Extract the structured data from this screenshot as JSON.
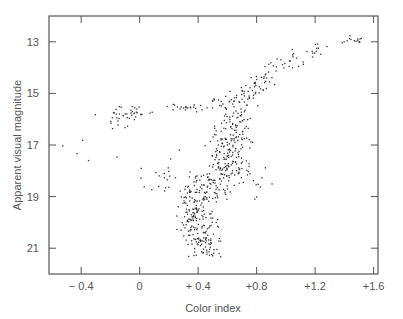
{
  "chart_data": {
    "type": "scatter",
    "title": "",
    "xlabel": "Color index",
    "ylabel": "Apparent visual magnitude",
    "xlim": [
      -0.62,
      1.63
    ],
    "ylim": [
      12.0,
      22.0
    ],
    "y_inverted": true,
    "grid": false,
    "legend": "none",
    "x_ticks": [
      {
        "value": -0.4,
        "label": "− 0.4"
      },
      {
        "value": 0,
        "label": "0"
      },
      {
        "value": 0.4,
        "label": "+ 0.4"
      },
      {
        "value": 0.8,
        "label": "+0.8"
      },
      {
        "value": 1.2,
        "label": "+1.2"
      },
      {
        "value": 1.6,
        "label": "+1.6"
      }
    ],
    "y_ticks": [
      {
        "value": 13,
        "label": "13"
      },
      {
        "value": 15,
        "label": "15"
      },
      {
        "value": 17,
        "label": "17"
      },
      {
        "value": 19,
        "label": "19"
      },
      {
        "value": 21,
        "label": "21"
      }
    ],
    "point_color": "#333333",
    "series": [
      {
        "name": "red giant branch",
        "clusters": [
          {
            "x": 1.45,
            "y": 12.9,
            "sx": 0.05,
            "sy": 0.1,
            "n": 14
          },
          {
            "x": 1.2,
            "y": 13.3,
            "sx": 0.06,
            "sy": 0.2,
            "n": 14
          },
          {
            "x": 1.0,
            "y": 13.7,
            "sx": 0.05,
            "sy": 0.2,
            "n": 14
          },
          {
            "x": 0.9,
            "y": 14.2,
            "sx": 0.04,
            "sy": 0.2,
            "n": 16
          },
          {
            "x": 0.8,
            "y": 14.6,
            "sx": 0.04,
            "sy": 0.2,
            "n": 20
          },
          {
            "x": 0.72,
            "y": 15.1,
            "sx": 0.05,
            "sy": 0.2,
            "n": 24
          }
        ]
      },
      {
        "name": "subgiant / upper main sequence",
        "clusters": [
          {
            "x": 0.65,
            "y": 15.9,
            "sx": 0.06,
            "sy": 0.35,
            "n": 50
          },
          {
            "x": 0.62,
            "y": 16.9,
            "sx": 0.07,
            "sy": 0.4,
            "n": 90
          },
          {
            "x": 0.6,
            "y": 17.8,
            "sx": 0.07,
            "sy": 0.35,
            "n": 80
          },
          {
            "x": 0.55,
            "y": 15.3,
            "sx": 0.06,
            "sy": 0.15,
            "n": 14
          }
        ]
      },
      {
        "name": "main sequence turnoff and dwarfs",
        "clusters": [
          {
            "x": 0.45,
            "y": 18.6,
            "sx": 0.09,
            "sy": 0.3,
            "n": 80
          },
          {
            "x": 0.38,
            "y": 19.4,
            "sx": 0.05,
            "sy": 0.35,
            "n": 70
          },
          {
            "x": 0.4,
            "y": 20.2,
            "sx": 0.06,
            "sy": 0.35,
            "n": 70
          },
          {
            "x": 0.45,
            "y": 20.9,
            "sx": 0.06,
            "sy": 0.25,
            "n": 50
          }
        ]
      },
      {
        "name": "horizontal branch",
        "clusters": [
          {
            "x": -0.05,
            "y": 15.7,
            "sx": 0.07,
            "sy": 0.15,
            "n": 30
          },
          {
            "x": -0.15,
            "y": 16.0,
            "sx": 0.04,
            "sy": 0.2,
            "n": 12
          },
          {
            "x": 0.3,
            "y": 15.55,
            "sx": 0.06,
            "sy": 0.08,
            "n": 22
          }
        ]
      },
      {
        "name": "field / blue stragglers",
        "clusters": [
          {
            "x": 0.15,
            "y": 18.2,
            "sx": 0.12,
            "sy": 0.6,
            "n": 18
          },
          {
            "x": 0.85,
            "y": 18.5,
            "sx": 0.06,
            "sy": 0.4,
            "n": 10
          },
          {
            "x": -0.45,
            "y": 17.0,
            "sx": 0.15,
            "sy": 0.8,
            "n": 6
          }
        ]
      }
    ]
  }
}
